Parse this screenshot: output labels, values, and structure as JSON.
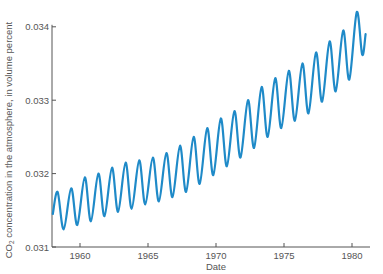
{
  "chart_data": {
    "type": "line",
    "title": "",
    "xlabel": "Date",
    "ylabel": "CO2 concentration in the atmosphere, in volume percent",
    "ylabel_parts": {
      "pre": "CO",
      "sub": "2",
      "post": " concentration in the atmosphere, in volume percent"
    },
    "xlim": [
      1958.0,
      1981.5
    ],
    "ylim": [
      0.031,
      0.0342
    ],
    "grid": false,
    "legend": null,
    "x_ticks": [
      1960,
      1965,
      1970,
      1975,
      1980
    ],
    "x_tick_labels": [
      "1960",
      "1965",
      "1970",
      "1975",
      "1980"
    ],
    "y_ticks": [
      0.031,
      0.032,
      0.033,
      0.034
    ],
    "y_tick_labels": [
      "0.031",
      "0.032",
      "0.033",
      "0.034"
    ],
    "line_color": "#1f8ac8",
    "series": [
      {
        "name": "CO2 concentration",
        "description": "Seasonal oscillation (one cycle per year) on a rising trend",
        "x": [
          1958.0,
          1958.35,
          1958.8,
          1959.35,
          1959.8,
          1960.35,
          1960.8,
          1961.35,
          1961.8,
          1962.35,
          1962.8,
          1963.35,
          1963.8,
          1964.35,
          1964.8,
          1965.35,
          1965.8,
          1966.35,
          1966.8,
          1967.35,
          1967.8,
          1968.35,
          1968.8,
          1969.35,
          1969.8,
          1970.35,
          1970.8,
          1971.35,
          1971.8,
          1972.35,
          1972.8,
          1973.35,
          1973.8,
          1974.35,
          1974.8,
          1975.35,
          1975.8,
          1976.35,
          1976.8,
          1977.35,
          1977.8,
          1978.35,
          1978.8,
          1979.35,
          1979.8,
          1980.35,
          1980.75,
          1981.0
        ],
        "values": [
          0.03145,
          0.03175,
          0.03124,
          0.0318,
          0.0313,
          0.03195,
          0.03135,
          0.032,
          0.03142,
          0.03208,
          0.03148,
          0.03215,
          0.03152,
          0.03218,
          0.03158,
          0.03222,
          0.03162,
          0.03228,
          0.03168,
          0.03238,
          0.03175,
          0.0325,
          0.03186,
          0.03262,
          0.03198,
          0.03275,
          0.0321,
          0.03285,
          0.03222,
          0.033,
          0.03235,
          0.03318,
          0.0325,
          0.0333,
          0.03262,
          0.0334,
          0.03272,
          0.0335,
          0.03282,
          0.03365,
          0.03298,
          0.0338,
          0.03312,
          0.03395,
          0.03328,
          0.0342,
          0.03362,
          0.0339
        ]
      }
    ]
  }
}
